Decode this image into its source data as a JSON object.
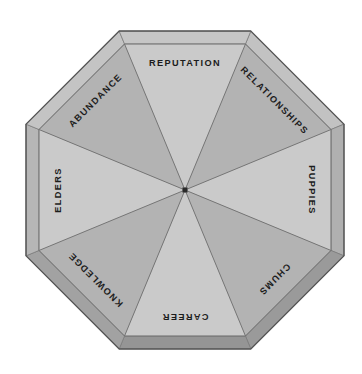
{
  "figure": {
    "kind": "umbrella-segment-diagram",
    "shape": "octagon",
    "panel_count": 8,
    "title": "",
    "background_color": "#ffffff"
  },
  "colors": {
    "panel_light": "#cacaca",
    "panel_dark": "#b3b3b3",
    "rim_light": "#bdbdbd",
    "rim_dark": "#9d9d9d",
    "outline": "#5a5a5a",
    "rib_line": "#6e6e6e",
    "hub": "#2a2a2a",
    "label_text": "#1c1c1c"
  },
  "geometry": {
    "center_x": 185,
    "center_y": 190,
    "outer_radius": 172,
    "rim_inset": 14,
    "label_radius": 126,
    "hub_size": 5
  },
  "panels": [
    {
      "id": "panel-reputation",
      "label": "REPUTATION",
      "angle_deg": 0,
      "position": "top",
      "rotation": 0,
      "fill": "panel_dark"
    },
    {
      "id": "panel-relationships",
      "label": "RELATIONSHIPS",
      "angle_deg": 45,
      "position": "top-right",
      "rotation": 45,
      "fill": "panel_light"
    },
    {
      "id": "panel-puppies",
      "label": "PUPPIES",
      "angle_deg": 90,
      "position": "right",
      "rotation": 90,
      "fill": "panel_dark"
    },
    {
      "id": "panel-chums",
      "label": "CHUMS",
      "angle_deg": 135,
      "position": "bottom-right",
      "rotation": 135,
      "fill": "panel_light"
    },
    {
      "id": "panel-career",
      "label": "CAREER",
      "angle_deg": 180,
      "position": "bottom",
      "rotation": 180,
      "fill": "panel_dark"
    },
    {
      "id": "panel-knowledge",
      "label": "KNOWLEDGE",
      "angle_deg": 225,
      "position": "bottom-left",
      "rotation": 225,
      "fill": "panel_light"
    },
    {
      "id": "panel-elders",
      "label": "ELDERS",
      "angle_deg": 270,
      "position": "left",
      "rotation": 270,
      "fill": "panel_dark"
    },
    {
      "id": "panel-abundance",
      "label": "ABUNDANCE",
      "angle_deg": 315,
      "position": "top-left",
      "rotation": 315,
      "fill": "panel_light"
    }
  ]
}
